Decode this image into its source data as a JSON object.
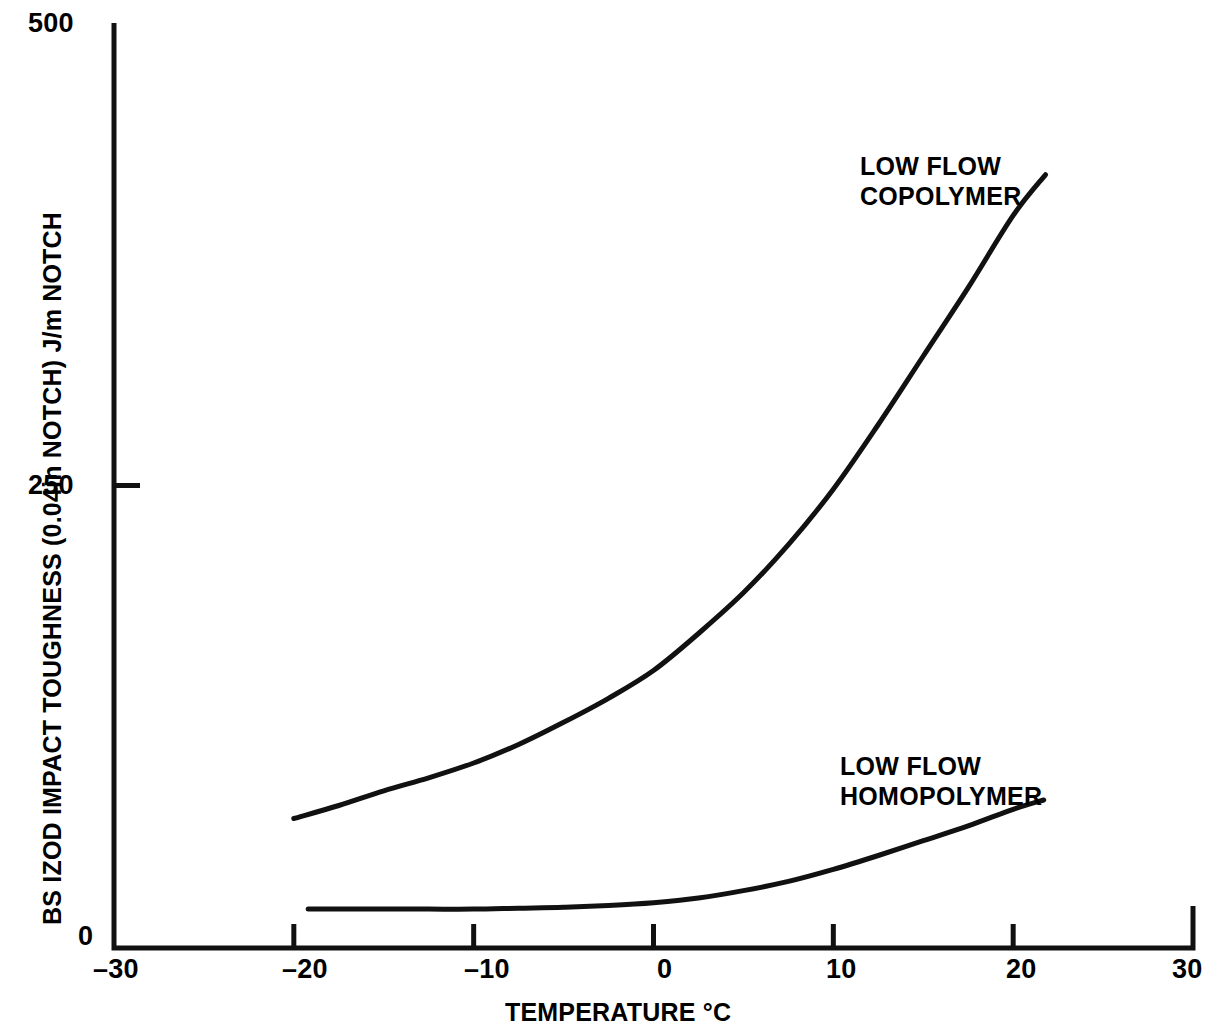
{
  "chart_data": {
    "type": "line",
    "title": "",
    "xlabel": "TEMPERATURE °C",
    "ylabel": "BS IZOD IMPACT TOUGHNESS (0.04in NOTCH) J/m NOTCH",
    "xlim": [
      -30,
      30
    ],
    "ylim": [
      0,
      500
    ],
    "x_ticks": [
      -30,
      -20,
      -10,
      0,
      10,
      20,
      30
    ],
    "x_tick_labels": [
      "–30",
      "–20",
      "–10",
      "0",
      "10",
      "20",
      "30"
    ],
    "y_ticks": [
      0,
      250,
      500
    ],
    "y_tick_labels": [
      "0",
      "250",
      "500"
    ],
    "grid": false,
    "legend": "inline-annotations",
    "line_color": "#111111",
    "background_color": "#ffffff",
    "series": [
      {
        "name": "LOW FLOW COPOLYMER",
        "label_text": "LOW FLOW\nCOPOLYMER",
        "x": [
          -20.0,
          -17.5,
          -15.0,
          -12.5,
          -10.0,
          -7.5,
          -5.0,
          -2.5,
          0.0,
          2.5,
          5.0,
          7.5,
          10.0,
          12.5,
          15.0,
          17.5,
          20.0,
          21.8
        ],
        "values": [
          70,
          77,
          85,
          92,
          100,
          110,
          122,
          135,
          150,
          170,
          192,
          218,
          248,
          283,
          320,
          357,
          396,
          418
        ]
      },
      {
        "name": "LOW FLOW HOMOPOLYMER",
        "label_text": "LOW FLOW\nHOMOPOLYMER",
        "x": [
          -19.2,
          -17.5,
          -15.0,
          -12.5,
          -10.0,
          -7.5,
          -5.0,
          -2.5,
          0.0,
          2.5,
          5.0,
          7.5,
          10.0,
          12.5,
          15.0,
          17.5,
          20.0,
          21.7
        ],
        "values": [
          21,
          21,
          21,
          21,
          21,
          21.5,
          22,
          23,
          24.5,
          27,
          31,
          36,
          42.5,
          50,
          58,
          66,
          75,
          80
        ]
      }
    ],
    "annotations": [
      {
        "text": "LOW FLOW\nCOPOLYMER",
        "x_px": 860,
        "y_px": 152
      },
      {
        "text": "LOW FLOW\nHOMOPOLYMER",
        "x_px": 840,
        "y_px": 752
      }
    ]
  }
}
